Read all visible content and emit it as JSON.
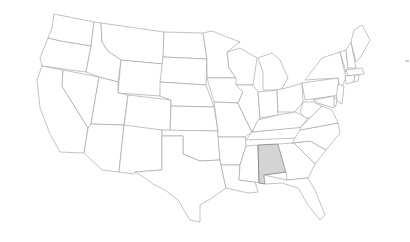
{
  "map": {
    "title": "United States",
    "highlighted_state": "Alabama",
    "highlight_color": "#d4d4d4",
    "default_fill": "#ffffff",
    "border_color": "#9a9a9a",
    "states": [
      {
        "id": "WA",
        "name": "Washington",
        "points": "54,14 94,22 91,46 60,41 48,38 52,28"
      },
      {
        "id": "OR",
        "name": "Oregon",
        "points": "48,38 60,41 91,46 86,72 42,66 40,58"
      },
      {
        "id": "CA",
        "name": "California",
        "points": "42,66 63,70 62,86 88,128 84,153 60,152 50,134 40,108 37,80"
      },
      {
        "id": "NV",
        "name": "Nevada",
        "points": "63,70 99,77 91,124 88,128 62,86"
      },
      {
        "id": "ID",
        "name": "Idaho",
        "points": "94,22 101,23 102,42 108,51 121,60 118,82 99,77 86,72 91,46"
      },
      {
        "id": "MT",
        "name": "Montana",
        "points": "101,23 164,32 163,64 121,60 108,51 102,42"
      },
      {
        "id": "WY",
        "name": "Wyoming",
        "points": "121,60 163,64 160,96 118,93"
      },
      {
        "id": "UT",
        "name": "Utah",
        "points": "99,77 118,82 118,93 128,95 124,125 91,124"
      },
      {
        "id": "CO",
        "name": "Colorado",
        "points": "128,95 171,100 170,131 124,127"
      },
      {
        "id": "AZ",
        "name": "Arizona",
        "points": "91,124 124,125 119,172 102,170 84,153 88,128"
      },
      {
        "id": "NM",
        "name": "New Mexico",
        "points": "124,125 162,130 162,170 135,172 134,174 119,172"
      },
      {
        "id": "ND",
        "name": "North Dakota",
        "points": "164,32 203,33 207,59 163,57"
      },
      {
        "id": "SD",
        "name": "South Dakota",
        "points": "163,57 207,59 206,85 160,82"
      },
      {
        "id": "NE",
        "name": "Nebraska",
        "points": "160,82 206,85 214,107 171,106 171,100 160,96"
      },
      {
        "id": "KS",
        "name": "Kansas",
        "points": "171,106 214,107 218,131 170,131"
      },
      {
        "id": "OK",
        "name": "Oklahoma",
        "points": "162,130 218,131 220,160 200,161 183,154 183,136 162,136"
      },
      {
        "id": "TX",
        "name": "Texas",
        "points": "162,136 183,136 183,154 200,161 220,160 226,188 212,198 200,205 200,222 190,220 178,200 165,190 153,184 142,176 135,172 162,170"
      },
      {
        "id": "MN",
        "name": "Minnesota",
        "points": "203,33 212,31 240,42 227,52 229,68 236,78 207,78 207,59"
      },
      {
        "id": "IA",
        "name": "Iowa",
        "points": "207,78 236,78 243,92 238,103 214,102"
      },
      {
        "id": "MO",
        "name": "Missouri",
        "points": "214,102 238,103 245,118 252,132 245,137 218,137 218,131"
      },
      {
        "id": "AR",
        "name": "Arkansas",
        "points": "218,137 245,137 246,146 240,165 221,165 220,160"
      },
      {
        "id": "LA",
        "name": "Louisiana",
        "points": "221,165 240,165 239,180 255,182 258,192 248,193 226,188"
      },
      {
        "id": "WI",
        "name": "Wisconsin",
        "points": "227,52 240,48 257,58 253,85 236,85 236,78 229,68"
      },
      {
        "id": "IL",
        "name": "Illinois",
        "points": "236,85 253,85 258,92 260,118 252,132 245,118 238,103 243,92"
      },
      {
        "id": "MI",
        "name": "Michigan",
        "points": "258,58 272,53 280,60 288,78 281,90 263,90 263,72"
      },
      {
        "id": "IN",
        "name": "Indiana",
        "points": "258,92 277,90 278,115 260,118"
      },
      {
        "id": "OH",
        "name": "Ohio",
        "points": "277,90 290,87 302,83 303,102 295,112 278,112"
      },
      {
        "id": "KY",
        "name": "Kentucky",
        "points": "258,120 278,115 295,112 308,118 300,128 252,132"
      },
      {
        "id": "TN",
        "name": "Tennessee",
        "points": "252,132 306,127 336,123 325,137 246,140"
      },
      {
        "id": "MS",
        "name": "Mississippi",
        "points": "246,146 258,145 259,183 255,182 239,180 240,165"
      },
      {
        "id": "AL",
        "name": "Alabama",
        "points": "258,145 278,144 286,172 264,175 265,184 259,183",
        "highlight": true
      },
      {
        "id": "GA",
        "name": "Georgia",
        "points": "278,144 294,143 315,164 308,178 287,180 286,172"
      },
      {
        "id": "FL",
        "name": "Florida",
        "points": "264,175 287,180 308,178 315,190 325,215 320,220 308,205 298,188 282,183 265,184"
      },
      {
        "id": "SC",
        "name": "South Carolina",
        "points": "294,143 310,141 326,150 315,164"
      },
      {
        "id": "NC",
        "name": "North Carolina",
        "points": "300,130 338,123 340,133 326,150 310,141 292,143"
      },
      {
        "id": "VA",
        "name": "Virginia",
        "points": "300,128 310,118 322,106 332,110 338,123 300,130"
      },
      {
        "id": "WV",
        "name": "West Virginia",
        "points": "303,102 313,102 322,106 310,118 305,118 300,112"
      },
      {
        "id": "PA",
        "name": "Pennsylvania",
        "points": "302,83 338,78 340,95 305,100"
      },
      {
        "id": "NY",
        "name": "New York",
        "points": "305,80 322,58 340,52 346,78 340,90 338,78"
      },
      {
        "id": "VT",
        "name": "Vermont",
        "points": "340,52 346,50 348,67 346,72"
      },
      {
        "id": "NH",
        "name": "New Hampshire",
        "points": "346,50 351,42 356,68 348,68"
      },
      {
        "id": "ME",
        "name": "Maine",
        "points": "351,42 354,30 362,25 370,40 360,58 356,62"
      },
      {
        "id": "MA",
        "name": "Massachusetts",
        "points": "346,70 362,68 364,74 348,76"
      },
      {
        "id": "CT",
        "name": "Connecticut",
        "points": "345,76 355,75 354,82 346,84"
      },
      {
        "id": "RI",
        "name": "Rhode Island",
        "points": "355,75 359,75 358,81 354,82"
      },
      {
        "id": "NJ",
        "name": "New Jersey",
        "points": "338,84 344,86 342,104 336,100"
      },
      {
        "id": "DE",
        "name": "Delaware",
        "points": "334,98 337,98 336,106 333,106"
      },
      {
        "id": "MD",
        "name": "Maryland",
        "points": "313,100 334,96 334,108 324,105 318,103"
      }
    ],
    "marks": [
      {
        "name": "dash-mark",
        "x1": 405,
        "y1": 61,
        "x2": 409,
        "y2": 61
      }
    ]
  }
}
